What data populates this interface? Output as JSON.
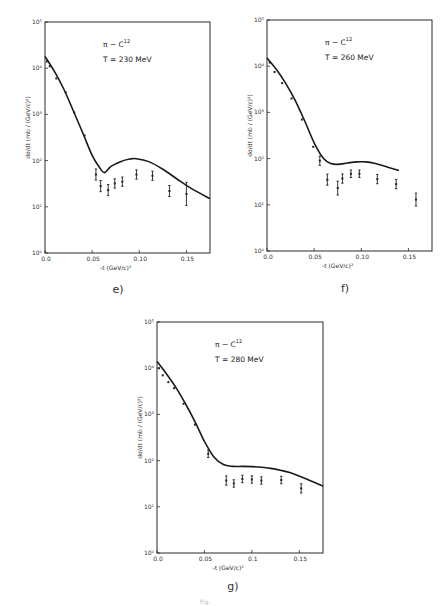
{
  "chart_data": [
    {
      "type": "scatter",
      "panel_label": "e)",
      "annotation_line1": "π − C",
      "annotation_sup": "12",
      "annotation_line2": "T = 230 MeV",
      "xlabel": "-t (GeV/c)²",
      "ylabel": "dσ/dt (mb / (GeV/c)²)",
      "xlim": [
        0,
        0.175
      ],
      "ylim": [
        1,
        100000
      ],
      "yscale": "log",
      "x_ticks": [
        "0.0",
        "0.05",
        "0.10",
        "0.15"
      ],
      "y_ticks": [
        "10⁰",
        "10¹",
        "10²",
        "10³",
        "10⁴",
        "10⁵"
      ],
      "series": [
        {
          "name": "theory",
          "kind": "line",
          "x": [
            0,
            0.01,
            0.02,
            0.03,
            0.04,
            0.05,
            0.058,
            0.063,
            0.07,
            0.08,
            0.09,
            0.097,
            0.11,
            0.125,
            0.14,
            0.155,
            0.175
          ],
          "y": [
            18000,
            8500,
            3500,
            1200,
            400,
            130,
            70,
            55,
            75,
            95,
            108,
            110,
            95,
            65,
            40,
            25,
            15
          ]
        },
        {
          "name": "data",
          "kind": "points",
          "x": [
            0.002,
            0.005,
            0.012,
            0.022,
            0.031,
            0.042,
            0.054,
            0.059,
            0.067,
            0.074,
            0.082,
            0.097,
            0.114,
            0.132,
            0.15
          ],
          "y": [
            14000,
            11000,
            6000,
            3000,
            1100,
            350,
            50,
            28,
            23,
            32,
            35,
            50,
            47,
            22,
            19
          ],
          "err": [
            0,
            0,
            0,
            0,
            0,
            0,
            0.12,
            0.12,
            0.12,
            0.1,
            0.1,
            0.1,
            0.1,
            0.12,
            0.25
          ]
        }
      ]
    },
    {
      "type": "scatter",
      "panel_label": "f)",
      "annotation_line1": "π − C",
      "annotation_sup": "12",
      "annotation_line2": "T = 260 MeV",
      "xlabel": "-t (GeV/c)²",
      "ylabel": "dσ/dt (mb / (GeV/c)²)",
      "xlim": [
        0,
        0.175
      ],
      "ylim": [
        1,
        100000
      ],
      "yscale": "log",
      "x_ticks": [
        "0.0",
        "0.05",
        "0.10",
        "0.15"
      ],
      "y_ticks": [
        "10⁰",
        "10¹",
        "10²",
        "10³",
        "10⁴",
        "10⁵"
      ],
      "series": [
        {
          "name": "theory",
          "kind": "line",
          "x": [
            0,
            0.01,
            0.02,
            0.03,
            0.04,
            0.05,
            0.06,
            0.068,
            0.075,
            0.085,
            0.095,
            0.105,
            0.115,
            0.125,
            0.14
          ],
          "y": [
            15000,
            8500,
            4200,
            1800,
            650,
            220,
            100,
            78,
            75,
            80,
            85,
            85,
            78,
            68,
            55
          ]
        },
        {
          "name": "data",
          "kind": "points",
          "x": [
            0.003,
            0.008,
            0.016,
            0.026,
            0.037,
            0.049,
            0.056,
            0.064,
            0.075,
            0.08,
            0.089,
            0.098,
            0.117,
            0.137,
            0.158
          ],
          "y": [
            12000,
            7500,
            4300,
            2000,
            700,
            180,
            90,
            35,
            23,
            37,
            47,
            47,
            36,
            28,
            13
          ],
          "err": [
            0,
            0,
            0,
            0,
            0,
            0,
            0.1,
            0.12,
            0.15,
            0.1,
            0.08,
            0.08,
            0.1,
            0.1,
            0.14
          ]
        }
      ]
    },
    {
      "type": "scatter",
      "panel_label": "g)",
      "annotation_line1": "π − C",
      "annotation_sup": "12",
      "annotation_line2": "T = 280 MeV",
      "xlabel": "-t (GeV/c)²",
      "ylabel": "dσ/dt (mb / (GeV/c)²)",
      "xlim": [
        0,
        0.175
      ],
      "ylim": [
        1,
        100000
      ],
      "yscale": "log",
      "x_ticks": [
        "0.0",
        "0.05",
        "0.1",
        "0.15"
      ],
      "y_ticks": [
        "10⁰",
        "10¹",
        "10²",
        "10³",
        "10⁴",
        "10⁵"
      ],
      "series": [
        {
          "name": "theory",
          "kind": "line",
          "x": [
            0,
            0.01,
            0.02,
            0.03,
            0.04,
            0.05,
            0.06,
            0.07,
            0.08,
            0.09,
            0.1,
            0.11,
            0.12,
            0.13,
            0.14,
            0.155,
            0.175
          ],
          "y": [
            14000,
            7500,
            3800,
            1700,
            700,
            260,
            120,
            82,
            75,
            75,
            74,
            72,
            68,
            62,
            55,
            42,
            28
          ]
        },
        {
          "name": "data",
          "kind": "points",
          "x": [
            0.002,
            0.006,
            0.012,
            0.018,
            0.028,
            0.04,
            0.054,
            0.073,
            0.081,
            0.09,
            0.1,
            0.11,
            0.131,
            0.152
          ],
          "y": [
            10000,
            7000,
            5000,
            3700,
            1700,
            600,
            140,
            37,
            32,
            40,
            39,
            37,
            38,
            25
          ],
          "err": [
            0,
            0,
            0,
            0,
            0,
            0,
            0.08,
            0.1,
            0.08,
            0.08,
            0.08,
            0.08,
            0.08,
            0.1
          ]
        }
      ]
    }
  ],
  "caption": "Fig."
}
